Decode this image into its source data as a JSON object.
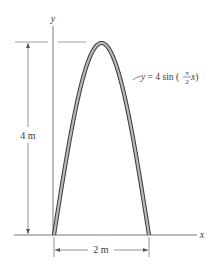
{
  "diagram": {
    "axes": {
      "x_label": "x",
      "y_label": "y"
    },
    "curve": {
      "equation_prefix": "y = 4 sin (",
      "fraction_numerator": "π",
      "fraction_denominator": "2",
      "equation_suffix": " x)",
      "amplitude_m": 4,
      "half_period_m": 2
    },
    "dimensions": {
      "height_label": "4 m",
      "width_label": "2 m"
    },
    "colors": {
      "arch_fill": "#b8b8b8",
      "arch_outline": "#3a3a3a",
      "axis": "#555555",
      "dimension": "#6a6a6a"
    }
  }
}
